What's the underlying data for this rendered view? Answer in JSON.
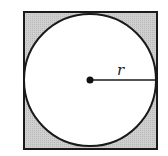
{
  "diagram": {
    "square": {
      "x": 24,
      "y": 12,
      "width": 133,
      "height": 137,
      "fill": "#c8c8c8",
      "stroke": "#1a1a1a"
    },
    "circle": {
      "cx": 90,
      "cy": 80,
      "r": 66,
      "fill": "#ffffff",
      "stroke": "#1a1a1a"
    },
    "center_point": {
      "cx": 90,
      "cy": 80,
      "r": 3.5
    },
    "radius_line": {
      "x1": 90,
      "y1": 80,
      "x2": 156,
      "y2": 80
    },
    "radius_label": "r"
  }
}
